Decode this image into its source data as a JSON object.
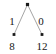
{
  "figure": {
    "kind": "binary-decision-tree",
    "background_color": "#ffffff",
    "edge_color": "#9a9a9a",
    "node_color": "#1a1a1a",
    "text_color": "#151515",
    "width": 56,
    "height": 54
  },
  "nodes": {
    "root": {
      "x": 27.5,
      "y": 4.5
    },
    "left_leaf": {
      "x": 14.0,
      "y": 34.5,
      "value": "8"
    },
    "right_leaf": {
      "x": 42.0,
      "y": 34.5,
      "value": "12"
    }
  },
  "edges": [
    {
      "name": "left-branch",
      "label": "1",
      "from": "root",
      "to": "left_leaf",
      "label_x": 12.0,
      "label_y": 21.0
    },
    {
      "name": "right-branch",
      "label": "0",
      "from": "root",
      "to": "right_leaf",
      "label_x": 41.0,
      "label_y": 21.0
    }
  ],
  "leaf_labels": [
    {
      "name": "left-leaf-value",
      "text": "8",
      "x": 12.0,
      "y": 45.5
    },
    {
      "name": "right-leaf-value",
      "text": "12",
      "x": 42.0,
      "y": 45.5
    }
  ]
}
